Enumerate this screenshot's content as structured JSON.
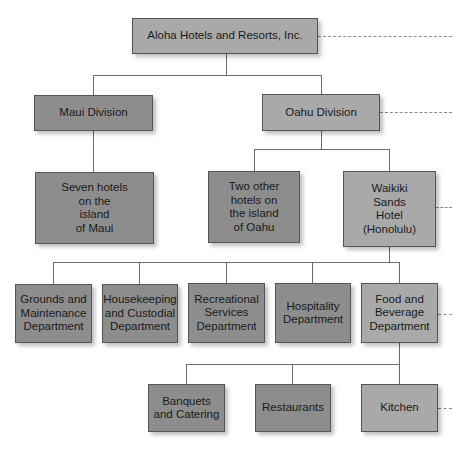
{
  "colors": {
    "primary_box": "#a9a9a9",
    "secondary_box": "#8d8d8d",
    "line": "#6b6b6b",
    "dashed": "#8a8a8a"
  },
  "chart": {
    "root": {
      "label": "Aloha Hotels and Resorts, Inc."
    },
    "divisions": [
      {
        "label": "Maui Division"
      },
      {
        "label": "Oahu Division"
      }
    ],
    "hotels": [
      {
        "label": "Seven hotels\non the\nisland\nof Maui"
      },
      {
        "label": "Two other\nhotels on\nthe island\nof Oahu"
      },
      {
        "label": "Waikiki\nSands\nHotel\n(Honolulu)"
      }
    ],
    "departments": [
      {
        "label": "Grounds and\nMaintenance\nDepartment"
      },
      {
        "label": "Housekeeping\nand Custodial\nDepartment"
      },
      {
        "label": "Recreational\nServices\nDepartment"
      },
      {
        "label": "Hospitality\nDepartment"
      },
      {
        "label": "Food and\nBeverage\nDepartment"
      }
    ],
    "units": [
      {
        "label": "Banquets\nand Catering"
      },
      {
        "label": "Restaurants"
      },
      {
        "label": "Kitchen"
      }
    ]
  }
}
